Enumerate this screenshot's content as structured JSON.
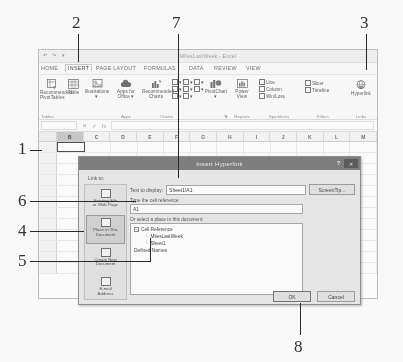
{
  "window": {
    "doc_title": "MilesLastWeek - Excel",
    "qat": "↶ ↷ ▾"
  },
  "ribbon": {
    "tabs": [
      {
        "label": "HOME",
        "active": false
      },
      {
        "label": "INSERT",
        "active": true
      },
      {
        "label": "PAGE LAYOUT",
        "active": false
      },
      {
        "label": "FORMULAS",
        "active": false
      },
      {
        "label": "DATA",
        "active": false
      },
      {
        "label": "REVIEW",
        "active": false
      },
      {
        "label": "VIEW",
        "active": false
      }
    ],
    "groups": [
      {
        "name": "Tables",
        "label": "Tables"
      },
      {
        "name": "Illustrations",
        "label": ""
      },
      {
        "name": "Apps",
        "label": "Apps"
      },
      {
        "name": "Charts",
        "label": "Charts"
      },
      {
        "name": "Reports",
        "label": "Reports"
      },
      {
        "name": "Sparklines",
        "label": "Sparklines"
      },
      {
        "name": "Filters",
        "label": "Filters"
      },
      {
        "name": "Links",
        "label": "Links"
      }
    ],
    "commands": {
      "recommended_pivottables": "Recommended\nPivotTables",
      "recommended_pivottables_l1": "Recommended",
      "recommended_pivottables_l2": "PivotTables",
      "table": "Table",
      "illustrations": "Illustrations",
      "illustrations_arrow": "▾",
      "apps_for_office_l1": "Apps for",
      "apps_for_office_l2": "Office ▾",
      "recommended_charts_l1": "Recommended",
      "recommended_charts_l2": "Charts",
      "pivotchart": "PivotChart",
      "pivotchart_arrow": "▾",
      "power_view_l1": "Power",
      "power_view_l2": "View",
      "line": "Line",
      "column": "Column",
      "winloss": "Win/Loss",
      "slicer": "Slicer",
      "timeline": "Timeline",
      "hyperlink": "Hyperlink"
    }
  },
  "formula_bar": {
    "name_box": "",
    "cancel": "✕",
    "confirm": "✓",
    "fx": "fx",
    "value": ""
  },
  "grid": {
    "columns": [
      "B",
      "C",
      "D",
      "E",
      "F",
      "G",
      "H",
      "I",
      "J",
      "K",
      "L",
      "M"
    ],
    "selected_column": "B",
    "active_cell": "B1",
    "row_count": 12
  },
  "dialog": {
    "title": "Insert Hyperlink",
    "help_label": "?",
    "close_label": "✕",
    "link_to_label": "Link to:",
    "sidebar": [
      {
        "label_line1": "Existing File",
        "label_line2": "or Web Page",
        "icon": "folder-icon",
        "selected": false
      },
      {
        "label_line1": "Place in This",
        "label_line2": "Document",
        "icon": "document-place-icon",
        "selected": true
      },
      {
        "label_line1": "Create New",
        "label_line2": "Document",
        "icon": "new-document-icon",
        "selected": false
      },
      {
        "label_line1": "E-mail",
        "label_line2": "Address",
        "icon": "envelope-icon",
        "selected": false
      }
    ],
    "text_to_display_label": "Text to display:",
    "text_to_display_value": "Sheet1!A1",
    "screentip_button": "ScreenTip...",
    "cell_reference_label": "Type the cell reference:",
    "cell_reference_value": "A1",
    "place_label": "Or select a place in this document:",
    "tree": [
      {
        "label": "Cell Reference",
        "level": 0,
        "expander": "−"
      },
      {
        "label": "MilesLastWeek",
        "level": 1,
        "expander": ""
      },
      {
        "label": "Sheet1",
        "level": 1,
        "expander": ""
      },
      {
        "label": "Defined Names",
        "level": 0,
        "expander": ""
      }
    ],
    "ok_button": "OK",
    "cancel_button": "Cancel"
  },
  "callouts": [
    {
      "number": "1",
      "target": "active-cell-b1"
    },
    {
      "number": "2",
      "target": "insert-tab"
    },
    {
      "number": "3",
      "target": "hyperlink-button"
    },
    {
      "number": "4",
      "target": "place-in-this-document-option"
    },
    {
      "number": "5",
      "target": "defined-names-node"
    },
    {
      "number": "6",
      "target": "cell-reference-input"
    },
    {
      "number": "7",
      "target": "text-to-display-input"
    },
    {
      "number": "8",
      "target": "ok-button"
    }
  ]
}
